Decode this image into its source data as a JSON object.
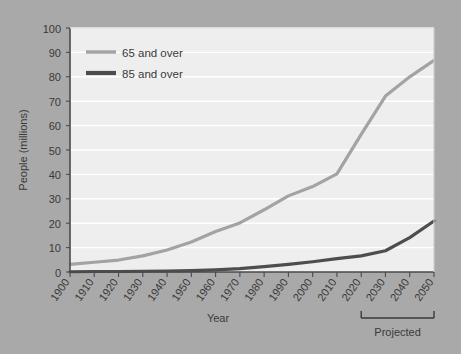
{
  "chart_data": {
    "type": "line",
    "title": "",
    "xlabel": "Year",
    "ylabel": "People (millions)",
    "xlim": [
      1900,
      2050
    ],
    "ylim": [
      0,
      100
    ],
    "ytick_values": [
      0,
      10,
      20,
      30,
      40,
      50,
      60,
      70,
      80,
      90,
      100
    ],
    "ytick_labels": [
      "0",
      "10",
      "20",
      "30",
      "40",
      "50",
      "60",
      "70",
      "80",
      "90",
      "100"
    ],
    "xtick_values": [
      1900,
      1910,
      1920,
      1930,
      1940,
      1950,
      1960,
      1970,
      1980,
      1990,
      2000,
      2010,
      2020,
      2030,
      2040,
      2050
    ],
    "xtick_labels": [
      "1900",
      "1910",
      "1920",
      "1930",
      "1940",
      "1950",
      "1960",
      "1970",
      "1980",
      "1990",
      "2000",
      "2010",
      "2020",
      "2030",
      "2040",
      "2050"
    ],
    "grid": "horizontal",
    "legend_position": "top-left",
    "x": [
      1900,
      1910,
      1920,
      1930,
      1940,
      1950,
      1960,
      1970,
      1980,
      1990,
      2000,
      2010,
      2020,
      2030,
      2040,
      2050
    ],
    "series": [
      {
        "name": "65 and over",
        "color": "#a3a3a3",
        "values": [
          3.1,
          4.0,
          4.9,
          6.6,
          9.0,
          12.3,
          16.6,
          20.1,
          25.5,
          31.2,
          35.0,
          40.2,
          56.4,
          72.1,
          80.0,
          86.7
        ]
      },
      {
        "name": "85 and over",
        "color": "#4d4d4d",
        "values": [
          0.1,
          0.2,
          0.2,
          0.3,
          0.4,
          0.6,
          0.9,
          1.4,
          2.2,
          3.1,
          4.2,
          5.5,
          6.6,
          8.7,
          14.1,
          20.9
        ]
      }
    ],
    "annotation": {
      "label": "Projected",
      "bracket_start_year": 2020,
      "bracket_end_year": 2050
    },
    "colors": {
      "figure_background": "#a9a9a9",
      "plot_background": "#eeeeee",
      "gridline": "#ffffff",
      "axis": "#4a4a4a",
      "text": "#3a3a3a"
    }
  },
  "legend": {
    "items": [
      {
        "label": "65 and over"
      },
      {
        "label": "85 and over"
      }
    ]
  },
  "axis_titles": {
    "x": "Year",
    "y": "People (millions)"
  },
  "annotations": {
    "projected": "Projected"
  }
}
